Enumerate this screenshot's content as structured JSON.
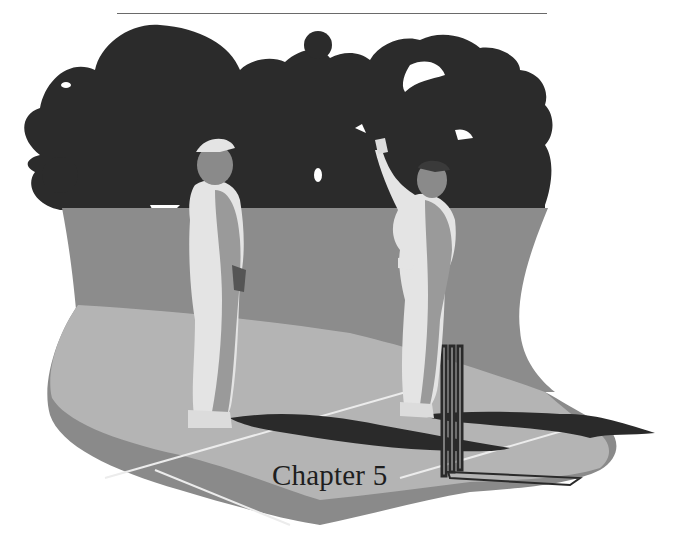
{
  "page": {
    "chapter_title": "Chapter 5"
  },
  "illustration": {
    "subject": "cricket-umpire-and-fielder-on-pitch",
    "colors": {
      "trees": "#2b2b2b",
      "outfield": "#8c8c8c",
      "pitch": "#b4b4b4",
      "pitch_edge": "#8a8a8a",
      "shadow": "#2a2a2a",
      "clothing_light": "#e4e4e4",
      "clothing_shade": "#9a9a9a",
      "crease_lines": "#ececec",
      "rule": "#6a6a6a"
    }
  }
}
